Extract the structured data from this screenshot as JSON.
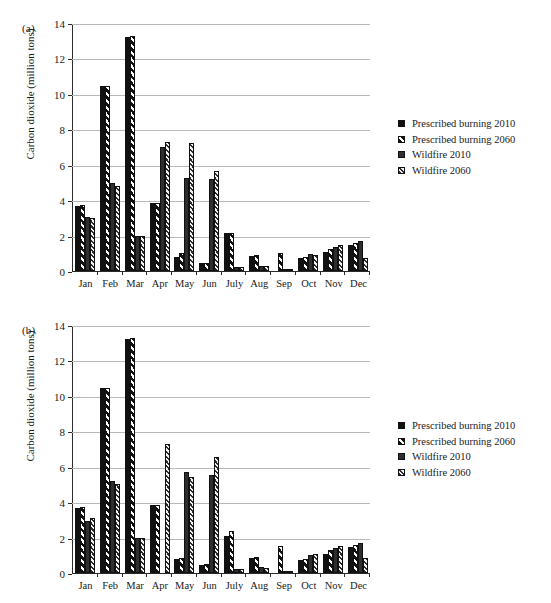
{
  "figure": {
    "ylabel": "Carbon dioxide (million tons)",
    "yticks": [
      "0",
      "2",
      "4",
      "6",
      "8",
      "10",
      "12",
      "14"
    ],
    "categories": [
      "Jan",
      "Feb",
      "Mar",
      "Apr",
      "May",
      "Jun",
      "July",
      "Aug",
      "Sep",
      "Oct",
      "Nov",
      "Dec"
    ],
    "legend": [
      {
        "label": "Prescribed burning 2010",
        "swatch": "solid-black"
      },
      {
        "label": "Prescribed burning 2060",
        "swatch": "coarse-hatch"
      },
      {
        "label": "Wildfire 2010",
        "swatch": "solid-dark"
      },
      {
        "label": "Wildfire 2060",
        "swatch": "fine-hatch"
      }
    ]
  },
  "panels": [
    {
      "id": "a",
      "label": "(a)"
    },
    {
      "id": "b",
      "label": "(b)"
    }
  ],
  "chart_data": [
    {
      "type": "bar",
      "panel": "(a)",
      "title": "",
      "xlabel": "",
      "ylabel": "Carbon dioxide (million tons)",
      "ylim": [
        0,
        14
      ],
      "ytick_step": 2,
      "grid": true,
      "legend_position": "right",
      "categories": [
        "Jan",
        "Feb",
        "Mar",
        "Apr",
        "May",
        "Jun",
        "July",
        "Aug",
        "Sep",
        "Oct",
        "Nov",
        "Dec"
      ],
      "series": [
        {
          "name": "Prescribed burning 2010",
          "values": [
            3.65,
            10.45,
            13.2,
            3.85,
            0.8,
            0.45,
            2.15,
            0.85,
            0.0,
            0.75,
            1.1,
            1.45
          ]
        },
        {
          "name": "Prescribed burning 2060",
          "values": [
            3.75,
            10.45,
            13.25,
            3.85,
            1.0,
            0.45,
            2.15,
            0.9,
            1.0,
            0.8,
            1.25,
            1.6
          ]
        },
        {
          "name": "Wildfire 2010",
          "values": [
            3.05,
            4.95,
            1.95,
            7.0,
            5.25,
            5.2,
            0.2,
            0.3,
            0.1,
            0.95,
            1.35,
            1.7
          ]
        },
        {
          "name": "Wildfire 2060",
          "values": [
            3.0,
            4.8,
            1.95,
            7.3,
            7.2,
            5.65,
            0.2,
            0.3,
            0.1,
            0.9,
            1.45,
            0.75
          ]
        }
      ]
    },
    {
      "type": "bar",
      "panel": "(b)",
      "title": "",
      "xlabel": "",
      "ylabel": "Carbon dioxide (million tons)",
      "ylim": [
        0,
        14
      ],
      "ytick_step": 2,
      "grid": true,
      "legend_position": "right",
      "categories": [
        "Jan",
        "Feb",
        "Mar",
        "Apr",
        "May",
        "Jun",
        "July",
        "Aug",
        "Sep",
        "Oct",
        "Nov",
        "Dec"
      ],
      "series": [
        {
          "name": "Prescribed burning 2010",
          "values": [
            3.65,
            10.45,
            13.2,
            3.85,
            0.8,
            0.45,
            2.1,
            0.85,
            0.0,
            0.75,
            1.1,
            1.45
          ]
        },
        {
          "name": "Prescribed burning 2060",
          "values": [
            3.7,
            10.45,
            13.25,
            3.85,
            0.85,
            0.5,
            2.4,
            0.9,
            1.55,
            0.8,
            1.3,
            1.6
          ]
        },
        {
          "name": "Wildfire 2010",
          "values": [
            2.95,
            5.2,
            1.95,
            0.0,
            5.7,
            5.55,
            0.2,
            0.35,
            0.1,
            1.0,
            1.4,
            1.7
          ]
        },
        {
          "name": "Wildfire 2060",
          "values": [
            3.1,
            5.05,
            1.95,
            7.3,
            5.4,
            6.55,
            0.25,
            0.3,
            0.1,
            1.1,
            1.5,
            0.85
          ]
        }
      ]
    }
  ]
}
